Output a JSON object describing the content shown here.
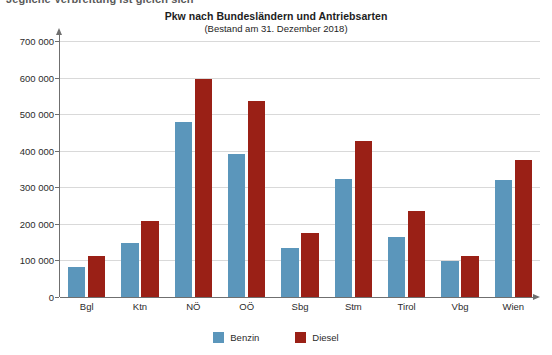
{
  "page": {
    "clipped_caption": "Jegliche Verbreitung ist gleich sich"
  },
  "chart_data": {
    "type": "bar",
    "title": "Pkw nach Bundesländern und Antriebsarten",
    "subtitle": "(Bestand am 31. Dezember 2018)",
    "xlabel": "",
    "ylabel": "",
    "categories": [
      "Bgl",
      "Ktn",
      "NÖ",
      "OÖ",
      "Sbg",
      "Stm",
      "Tirol",
      "Vbg",
      "Wien"
    ],
    "series": [
      {
        "name": "Benzin",
        "color": "#5b96bb",
        "values": [
          83000,
          148000,
          479000,
          390000,
          135000,
          323000,
          165000,
          98000,
          320000
        ]
      },
      {
        "name": "Diesel",
        "color": "#9a2016",
        "values": [
          113000,
          207000,
          595000,
          535000,
          176000,
          427000,
          234000,
          112000,
          375000
        ]
      }
    ],
    "ylim": [
      0,
      700000
    ],
    "yticks": [
      0,
      100000,
      200000,
      300000,
      400000,
      500000,
      600000,
      700000
    ],
    "ytick_labels": [
      "0",
      "100 000",
      "200 000",
      "300 000",
      "400 000",
      "500 000",
      "600 000",
      "700 000"
    ],
    "grid": true,
    "legend_position": "bottom",
    "legend": [
      "Benzin",
      "Diesel"
    ]
  }
}
